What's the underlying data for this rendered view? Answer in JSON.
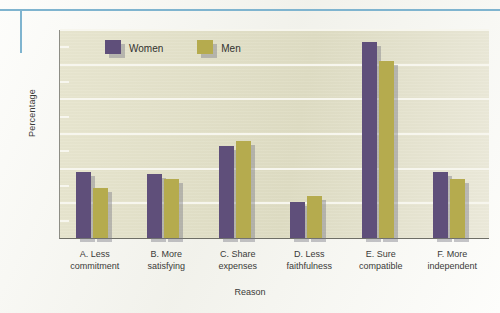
{
  "page": {
    "rule_color": "#7fb4cf"
  },
  "chart_data": {
    "type": "bar",
    "title": "",
    "xlabel": "Reason",
    "ylabel": "Percentage",
    "ylim": [
      0,
      60
    ],
    "yticks": [
      0,
      10,
      20,
      30,
      40,
      50,
      60
    ],
    "ytick_labels": [
      "0",
      "10",
      "20",
      "30",
      "40",
      "50",
      "60"
    ],
    "minor_tick_step": 5,
    "grid": "horizontal",
    "legend_position": "top-left-inside",
    "plot_background": "#e4e2cb",
    "categories": [
      "A. Less commitment",
      "B. More satisfying",
      "C. Share expenses",
      "D. Less faithfulness",
      "E. Sure compatible",
      "F. More independent"
    ],
    "category_lines": [
      [
        "A. Less",
        "commitment"
      ],
      [
        "B. More",
        "satisfying"
      ],
      [
        "C. Share",
        "expenses"
      ],
      [
        "D. Less",
        "faithfulness"
      ],
      [
        "E. Sure",
        "compatible"
      ],
      [
        "F. More",
        "independent"
      ]
    ],
    "series": [
      {
        "name": "Women",
        "color": "#5f4f7a",
        "values": [
          19,
          18.5,
          26.5,
          10.5,
          56.5,
          19
        ]
      },
      {
        "name": "Men",
        "color": "#b5ab4e",
        "values": [
          14.5,
          17,
          28,
          12,
          51,
          17
        ]
      }
    ]
  }
}
